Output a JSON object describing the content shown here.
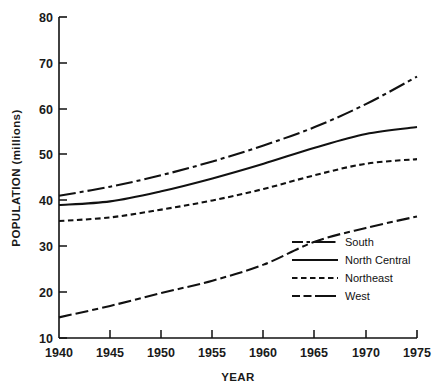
{
  "chart_data": {
    "type": "line",
    "title": "",
    "xlabel": "YEAR",
    "ylabel": "POPULATION (millions)",
    "xlim": [
      1940,
      1975
    ],
    "ylim": [
      10,
      80
    ],
    "xticks": [
      "1940",
      "1945",
      "1950",
      "1955",
      "1960",
      "1965",
      "1970",
      "1975"
    ],
    "yticks": [
      "10",
      "20",
      "30",
      "40",
      "50",
      "60",
      "70",
      "80"
    ],
    "grid": false,
    "legend_position": "inside-lower-right",
    "x": [
      1940,
      1945,
      1950,
      1955,
      1960,
      1965,
      1970,
      1975
    ],
    "series": [
      {
        "name": "South",
        "style": "dash-dot",
        "values": [
          41.0,
          43.0,
          45.5,
          48.5,
          52.0,
          56.0,
          61.0,
          67.0
        ]
      },
      {
        "name": "North Central",
        "style": "solid",
        "values": [
          39.0,
          39.8,
          42.0,
          44.8,
          48.0,
          51.5,
          54.5,
          56.0
        ]
      },
      {
        "name": "Northeast",
        "style": "dashed",
        "values": [
          35.5,
          36.3,
          38.0,
          40.0,
          42.5,
          45.5,
          48.0,
          49.0
        ]
      },
      {
        "name": "West",
        "style": "dash-dot-dash",
        "values": [
          14.5,
          17.0,
          19.8,
          22.5,
          26.0,
          31.0,
          34.0,
          36.5
        ]
      }
    ]
  },
  "axes": {
    "y_title": "POPULATION (millions)",
    "x_title": "YEAR",
    "y_tick_labels": [
      "80",
      "70",
      "60",
      "50",
      "40",
      "30",
      "20",
      "10"
    ],
    "x_tick_labels": [
      "1940",
      "1945",
      "1950",
      "1955",
      "1960",
      "1965",
      "1970",
      "1975"
    ]
  },
  "legend": {
    "entries": [
      {
        "label": "South",
        "style": "dash-dot"
      },
      {
        "label": "North Central",
        "style": "solid"
      },
      {
        "label": "Northeast",
        "style": "dashed"
      },
      {
        "label": "West",
        "style": "dash-dot-dash"
      }
    ]
  },
  "colors": {
    "ink": "#111111",
    "background": "#ffffff"
  }
}
